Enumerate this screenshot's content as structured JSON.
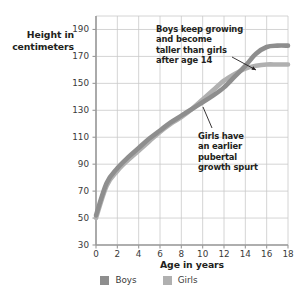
{
  "chart_data": {
    "type": "line",
    "title": "",
    "xlabel": "Age in years",
    "ylabel": "Height in centimeters",
    "xlim": [
      0,
      18
    ],
    "ylim": [
      30,
      200
    ],
    "grid": true,
    "xticks": [
      "0",
      "2",
      "4",
      "6",
      "8",
      "10",
      "12",
      "14",
      "16",
      "18"
    ],
    "yticks": [
      "30",
      "50",
      "70",
      "90",
      "110",
      "130",
      "150",
      "170",
      "190"
    ],
    "legend_position": "bottom-center",
    "x": [
      0,
      1,
      2,
      3,
      4,
      5,
      6,
      7,
      8,
      9,
      10,
      11,
      12,
      13,
      14,
      15,
      16,
      17,
      18
    ],
    "series": [
      {
        "name": "Boys",
        "color": "#8e8e8e",
        "values": [
          52,
          76,
          87,
          95,
          102,
          109,
          115,
          121,
          126,
          131,
          136,
          141,
          147,
          155,
          163,
          172,
          177,
          178,
          178
        ]
      },
      {
        "name": "Girls",
        "color": "#b0b0b0",
        "values": [
          50,
          74,
          85,
          93,
          100,
          107,
          114,
          120,
          125,
          131,
          138,
          145,
          152,
          157,
          161,
          163,
          164,
          164,
          164
        ]
      }
    ],
    "annotations": [
      {
        "id": "boys-note",
        "text": "Boys keep growing and become taller than girls after age 14",
        "lines": [
          "Boys keep growing",
          "and become",
          "taller than girls",
          "after age 14"
        ],
        "points_to_age": 15.5,
        "points_to_height": 172
      },
      {
        "id": "girls-note",
        "text": "Girls have an earlier pubertal growth spurt",
        "lines": [
          "Girls have",
          "an earlier",
          "pubertal",
          "growth spurt"
        ],
        "points_to_age": 11.5,
        "points_to_height": 146
      }
    ]
  },
  "axes": {
    "y_title": "Height in\ncentimeters",
    "y_title_line1": "Height in",
    "y_title_line2": "centimeters",
    "x_title": "Age in years"
  },
  "legend": {
    "items": [
      {
        "label": "Boys",
        "color": "#8e8e8e"
      },
      {
        "label": "Girls",
        "color": "#b0b0b0"
      }
    ]
  },
  "colors": {
    "grid": "#c9c9c9",
    "axis": "#9a9a9a",
    "text": "#231f20",
    "tick_text": "#3a3a3a",
    "boys": "#8e8e8e",
    "girls": "#b0b0b0",
    "background": "#ffffff"
  }
}
